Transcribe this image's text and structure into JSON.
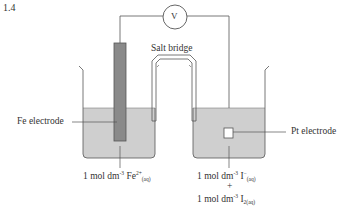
{
  "question_number": "1.4",
  "labels": {
    "voltmeter": "V",
    "salt_bridge": "Salt bridge",
    "fe_electrode": "Fe electrode",
    "pt_electrode": "Pt electrode"
  },
  "left_solution": {
    "prefix": "1 mol dm",
    "exp": "-3",
    "species": " Fe",
    "charge": "2+",
    "state": "(aq)"
  },
  "right_solution": {
    "line1": {
      "prefix": "1 mol dm",
      "exp": "-3",
      "species": " I",
      "charge": "−",
      "state": "(aq)"
    },
    "plus": "+",
    "line2": {
      "prefix": "1 mol dm",
      "exp": "-3",
      "species": " I",
      "charge": "",
      "state": "2(aq)"
    }
  },
  "colors": {
    "line": "#555555",
    "solution": "#cfcfcf",
    "fe_electrode": "#8a8a8a",
    "pt_electrode": "#ffffff"
  }
}
